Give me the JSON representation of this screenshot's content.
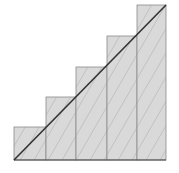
{
  "diagram": {
    "type": "upper-riemann-sum-staircase",
    "num_rectangles": 5,
    "origin": [
      14,
      160
    ],
    "width": 152,
    "height": 155,
    "column_edges_x": [
      14,
      46,
      76,
      107,
      137,
      166
    ],
    "step_tops_y": [
      127,
      97,
      67,
      36,
      5
    ],
    "diagonal": {
      "from": [
        14,
        160
      ],
      "to": [
        166,
        5
      ]
    },
    "colors": {
      "fill": "#d9d9d9",
      "edge": "#8a8a8a",
      "hatch": "#a0a0a0",
      "diagonal": "#333333",
      "baseline": "#444444"
    }
  }
}
